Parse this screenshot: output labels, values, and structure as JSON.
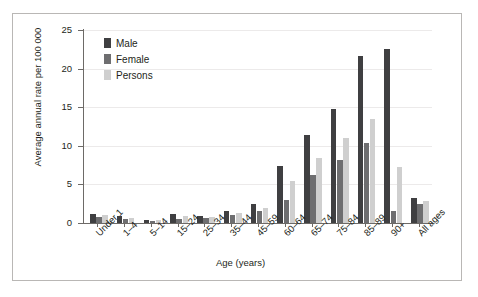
{
  "chart_data": {
    "type": "bar",
    "title": "",
    "xlabel": "Age (years)",
    "ylabel": "Average annual rate per 100 000",
    "ylim": [
      0,
      25
    ],
    "yticks": [
      0,
      5,
      10,
      15,
      20,
      25
    ],
    "grid": true,
    "legend_position": "top-left inside",
    "categories": [
      "Under 1",
      "1–4",
      "5–14",
      "15–24",
      "25–34",
      "35–44",
      "45–59",
      "60–64",
      "65–74",
      "75–84",
      "85–89",
      "90+",
      "All ages"
    ],
    "series": [
      {
        "name": "Male",
        "color": "#3f3f41",
        "values": [
          1.2,
          0.9,
          0.4,
          1.2,
          0.9,
          1.5,
          2.4,
          7.4,
          11.4,
          14.8,
          21.6,
          22.6,
          3.3
        ]
      },
      {
        "name": "Female",
        "color": "#6e6e70",
        "values": [
          0.8,
          0.5,
          0.3,
          0.5,
          0.6,
          1.0,
          1.6,
          3.0,
          6.2,
          8.2,
          10.4,
          1.6,
          2.4
        ]
      },
      {
        "name": "Persons",
        "color": "#cfcfcf",
        "values": [
          1.0,
          0.7,
          0.35,
          0.9,
          0.8,
          1.3,
          2.0,
          5.4,
          8.4,
          11.0,
          13.5,
          7.3,
          2.9
        ]
      }
    ]
  },
  "legend": {
    "items": [
      {
        "label": "Male",
        "color": "#3f3f41"
      },
      {
        "label": "Female",
        "color": "#6e6e70"
      },
      {
        "label": "Persons",
        "color": "#cfcfcf"
      }
    ]
  },
  "axes": {
    "y_label": "Average annual rate per 100 000",
    "x_label": "Age (years)",
    "y_ticks": [
      "0",
      "5",
      "10",
      "15",
      "20",
      "25"
    ]
  }
}
